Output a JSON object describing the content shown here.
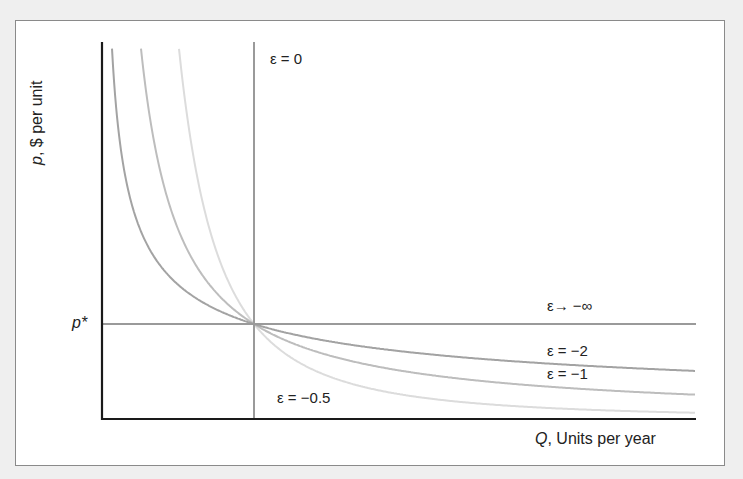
{
  "chart_data": {
    "type": "line",
    "title": "",
    "xlabel": "Q, Units per year",
    "ylabel": "p, $ per unit",
    "xlabel_var": "Q",
    "xlabel_rest": ", Units per year",
    "ylabel_var": "p",
    "ylabel_rest": ", $ per unit",
    "y_tick_labels": [
      "p*"
    ],
    "grid": false,
    "legend": "inline labels",
    "series": [
      {
        "name": "ε = 0",
        "kind": "vertical line at Q*",
        "elasticity": 0,
        "color": "#9a9a9a"
      },
      {
        "name": "ε → −∞",
        "kind": "horizontal line at p*",
        "elasticity": "-inf",
        "color": "#9a9a9a"
      },
      {
        "name": "ε = −2",
        "elasticity": -2,
        "color": "#a3a3a3"
      },
      {
        "name": "ε = −1",
        "elasticity": -1,
        "color": "#bdbdbd"
      },
      {
        "name": "ε = −0.5",
        "elasticity": -0.5,
        "color": "#dcdcdc"
      }
    ],
    "annotations": [
      "ε = 0",
      "ε→ −∞",
      "ε = −2",
      "ε = −1",
      "ε = −0.5"
    ]
  },
  "labels": {
    "eps0": "ε = 0",
    "epsInf": "ε→ −∞",
    "eps2": "ε = −2",
    "eps1": "ε = −1",
    "eps05": "ε = −0.5",
    "pstar": "p*"
  }
}
